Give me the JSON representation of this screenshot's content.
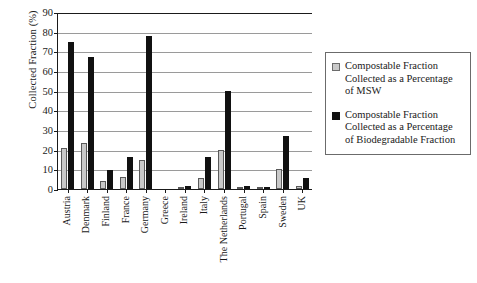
{
  "chart_data": {
    "type": "bar",
    "title": "",
    "xlabel": "",
    "ylabel": "Collected Fraction (%)",
    "ylim": [
      0,
      90
    ],
    "ytick_step": 10,
    "yticks": [
      0,
      10,
      20,
      30,
      40,
      50,
      60,
      70,
      80,
      90
    ],
    "grid": true,
    "legend_position": "right",
    "categories": [
      "Austria",
      "Denmark",
      "Finland",
      "France",
      "Germany",
      "Greece",
      "Ireland",
      "Italy",
      "The Netherlands",
      "Portugal",
      "Spain",
      "Sweden",
      "UK"
    ],
    "series": [
      {
        "name": "Compostable Fraction Collected as a Percentage of MSW",
        "color": "#c9c9c9",
        "values": [
          21,
          23.5,
          4,
          6,
          14.5,
          0,
          0.8,
          5.5,
          20,
          1,
          0.8,
          10,
          1.5
        ]
      },
      {
        "name": "Compostable Fraction Collected as a Percentage of Biodegradable Fraction",
        "color": "#111111",
        "values": [
          75,
          67,
          9.5,
          16.5,
          78,
          0.3,
          1.3,
          16.5,
          50,
          1.3,
          1,
          27,
          5.5
        ]
      }
    ]
  },
  "legend": {
    "entries": [
      {
        "line1": "Compostable Fraction",
        "line2": "Collected as a Percentage",
        "line3": "of MSW"
      },
      {
        "line1": "Compostable Fraction",
        "line2": "Collected as a Percentage",
        "line3": "of Biodegradable Fraction"
      }
    ]
  },
  "colors": {
    "series_msw": "#c9c9c9",
    "series_biodegradable": "#111111",
    "axis": "#1a1a1a",
    "grid": "#9a9a9a",
    "background": "#ffffff"
  }
}
